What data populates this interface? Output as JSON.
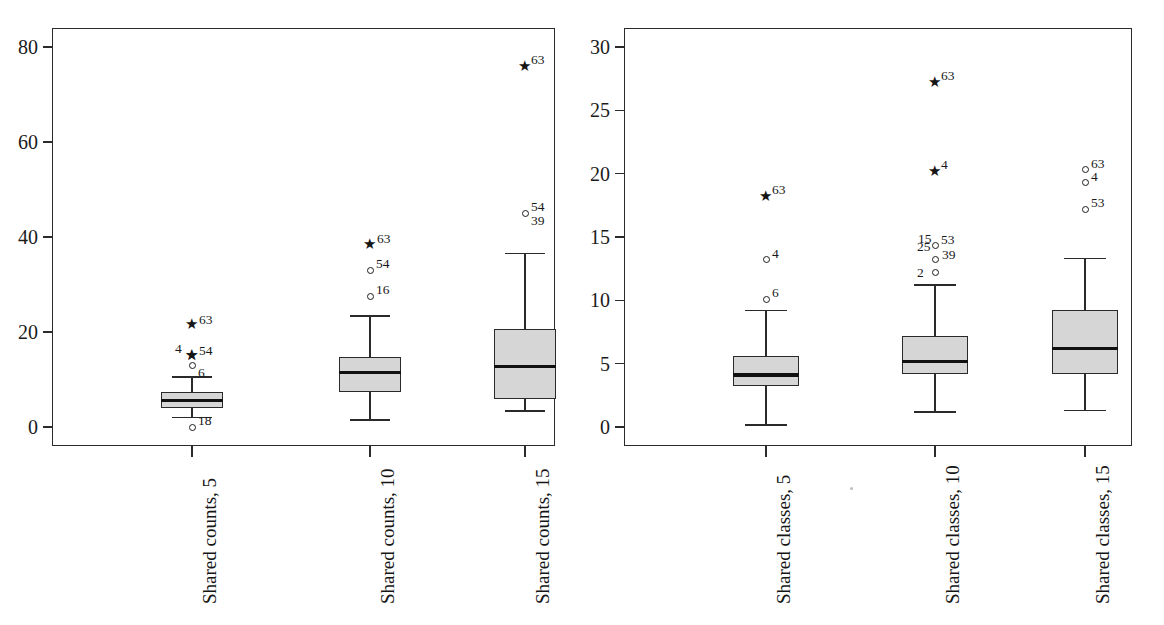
{
  "figure": {
    "type": "boxplot-figure",
    "panel_count": 2,
    "background": "#ffffff",
    "box_fill": "#d6d6d6",
    "line_color": "#2a2a2a"
  },
  "panels": [
    {
      "id": "left",
      "name": "shared-counts-panel",
      "ylim": [
        -4,
        84
      ],
      "yticks": [
        "0",
        "20",
        "40",
        "60",
        "80"
      ],
      "ytick_values": [
        0,
        20,
        40,
        60,
        80
      ],
      "categories": [
        "Shared counts, 5",
        "Shared counts, 10",
        "Shared counts, 15"
      ]
    },
    {
      "id": "right",
      "name": "shared-classes-panel",
      "ylim": [
        -1.5,
        31.5
      ],
      "yticks": [
        "0",
        "5",
        "10",
        "15",
        "20",
        "25",
        "30"
      ],
      "ytick_values": [
        0,
        5,
        10,
        15,
        20,
        25,
        30
      ],
      "categories": [
        "Shared classes, 5",
        "Shared classes, 10",
        "Shared classes, 15"
      ]
    }
  ],
  "chart_data": [
    {
      "type": "box",
      "title": "",
      "xlabel": "",
      "ylabel": "",
      "grid": false,
      "legend": "none",
      "ylim": [
        -4,
        84
      ],
      "yticks": [
        0,
        20,
        40,
        60,
        80
      ],
      "categories": [
        "Shared counts, 5",
        "Shared counts, 10",
        "Shared counts, 15"
      ],
      "boxes": [
        {
          "category": "Shared counts, 5",
          "whisker_low": 2.0,
          "q1": 4.0,
          "median": 5.5,
          "q3": 7.3,
          "whisker_high": 10.5,
          "outliers": [
            {
              "label": "63",
              "value": 21.5,
              "marker": "star",
              "label_pos": "right"
            },
            {
              "label": "54",
              "value": 15.0,
              "marker": "star",
              "label_pos": "right"
            },
            {
              "label": "4",
              "value": 15.0,
              "marker": "star",
              "label_pos": "upper-left"
            },
            {
              "label": "6",
              "value": 13.0,
              "marker": "circle",
              "label_pos": "lower-right"
            },
            {
              "label": "18",
              "value": 0.0,
              "marker": "circle",
              "label_pos": "upper-right"
            }
          ]
        },
        {
          "category": "Shared counts, 10",
          "whisker_low": 1.5,
          "q1": 7.4,
          "median": 11.5,
          "q3": 14.7,
          "whisker_high": 23.4,
          "outliers": [
            {
              "label": "63",
              "value": 38.5,
              "marker": "star",
              "label_pos": "right"
            },
            {
              "label": "54",
              "value": 33.0,
              "marker": "circle",
              "label_pos": "upper-right"
            },
            {
              "label": "16",
              "value": 27.5,
              "marker": "circle",
              "label_pos": "upper-right"
            }
          ]
        },
        {
          "category": "Shared counts, 15",
          "whisker_low": 3.4,
          "q1": 5.9,
          "median": 12.8,
          "q3": 20.7,
          "whisker_high": 36.5,
          "outliers": [
            {
              "label": "63",
              "value": 76.0,
              "marker": "star",
              "label_pos": "upper-right"
            },
            {
              "label": "54",
              "value": 45.0,
              "marker": "circle",
              "label_pos": "upper-right"
            },
            {
              "label": "39",
              "value": 45.0,
              "marker": "none",
              "label_pos": "lower-right"
            }
          ]
        }
      ]
    },
    {
      "type": "box",
      "title": "",
      "xlabel": "",
      "ylabel": "",
      "grid": false,
      "legend": "none",
      "ylim": [
        -1.5,
        31.5
      ],
      "yticks": [
        0,
        5,
        10,
        15,
        20,
        25,
        30
      ],
      "categories": [
        "Shared classes, 5",
        "Shared classes, 10",
        "Shared classes, 15"
      ],
      "boxes": [
        {
          "category": "Shared classes, 5",
          "whisker_low": 0.15,
          "q1": 3.2,
          "median": 4.1,
          "q3": 5.6,
          "whisker_high": 9.2,
          "outliers": [
            {
              "label": "63",
              "value": 18.2,
              "marker": "star",
              "label_pos": "upper-right"
            },
            {
              "label": "4",
              "value": 13.2,
              "marker": "circle",
              "label_pos": "upper-right"
            },
            {
              "label": "6",
              "value": 10.1,
              "marker": "circle",
              "label_pos": "upper-right"
            }
          ]
        },
        {
          "category": "Shared classes, 10",
          "whisker_low": 1.2,
          "q1": 4.2,
          "median": 5.2,
          "q3": 7.2,
          "whisker_high": 11.2,
          "outliers": [
            {
              "label": "63",
              "value": 27.2,
              "marker": "star",
              "label_pos": "upper-right"
            },
            {
              "label": "4",
              "value": 20.2,
              "marker": "star",
              "label_pos": "upper-right"
            },
            {
              "label": "53",
              "value": 14.3,
              "marker": "circle",
              "label_pos": "upper-right"
            },
            {
              "label": "15",
              "value": 14.3,
              "marker": "none",
              "label_pos": "upper-left"
            },
            {
              "label": "25",
              "value": 14.3,
              "marker": "none",
              "label_pos": "left"
            },
            {
              "label": "39",
              "value": 13.2,
              "marker": "circle",
              "label_pos": "right"
            },
            {
              "label": "2",
              "value": 12.2,
              "marker": "circle",
              "label_pos": "left"
            }
          ]
        },
        {
          "category": "Shared classes, 15",
          "whisker_low": 1.3,
          "q1": 4.2,
          "median": 6.2,
          "q3": 9.2,
          "whisker_high": 13.3,
          "outliers": [
            {
              "label": "63",
              "value": 20.3,
              "marker": "circle",
              "label_pos": "upper-right"
            },
            {
              "label": "4",
              "value": 19.3,
              "marker": "circle",
              "label_pos": "upper-right"
            },
            {
              "label": "53",
              "value": 17.2,
              "marker": "circle",
              "label_pos": "upper-right"
            }
          ]
        }
      ]
    }
  ]
}
